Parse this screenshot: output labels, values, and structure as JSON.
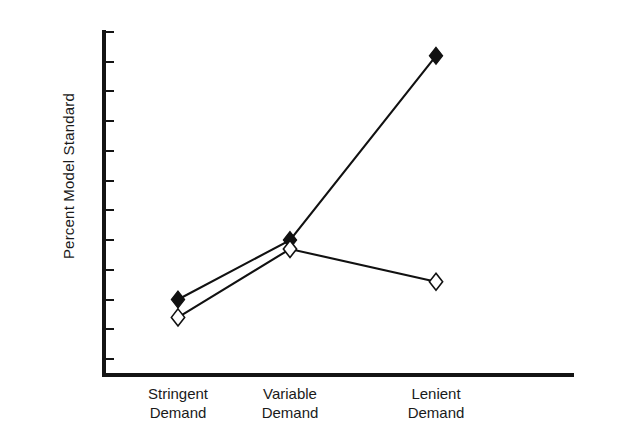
{
  "chart_data": {
    "type": "line",
    "title": "",
    "xlabel": "",
    "ylabel": "Percent Model Standard",
    "categories": [
      "Stringent\nDemand",
      "Variable\nDemand",
      "Lenient\nDemand"
    ],
    "category_lines": [
      [
        "Stringent",
        "Demand"
      ],
      [
        "Variable",
        "Demand"
      ],
      [
        "Lenient",
        "Demand"
      ]
    ],
    "x": [
      0,
      1,
      2
    ],
    "series": [
      {
        "name": "filled-diamond-series",
        "marker": "filled-diamond",
        "values": [
          1.0,
          1.1,
          1.41
        ]
      },
      {
        "name": "open-diamond-series",
        "marker": "open-diamond",
        "values": [
          0.97,
          1.085,
          1.03
        ]
      }
    ],
    "ylim": [
      0.9,
      1.45
    ],
    "yticks": [
      0.9,
      0.95,
      1.0,
      1.05,
      1.1,
      1.15,
      1.2,
      1.25,
      1.3,
      1.35,
      1.4,
      1.45
    ],
    "ytick_labels": [
      ".90",
      ".95",
      "1.00",
      "1.05",
      "1.10",
      "1.15",
      "1.20",
      "1.25",
      "1.30",
      "1.35",
      "1.40",
      "1.45"
    ],
    "grid": false,
    "legend": "none",
    "line_color": "#111111",
    "axis_color": "#141414",
    "background": "#ffffff"
  }
}
